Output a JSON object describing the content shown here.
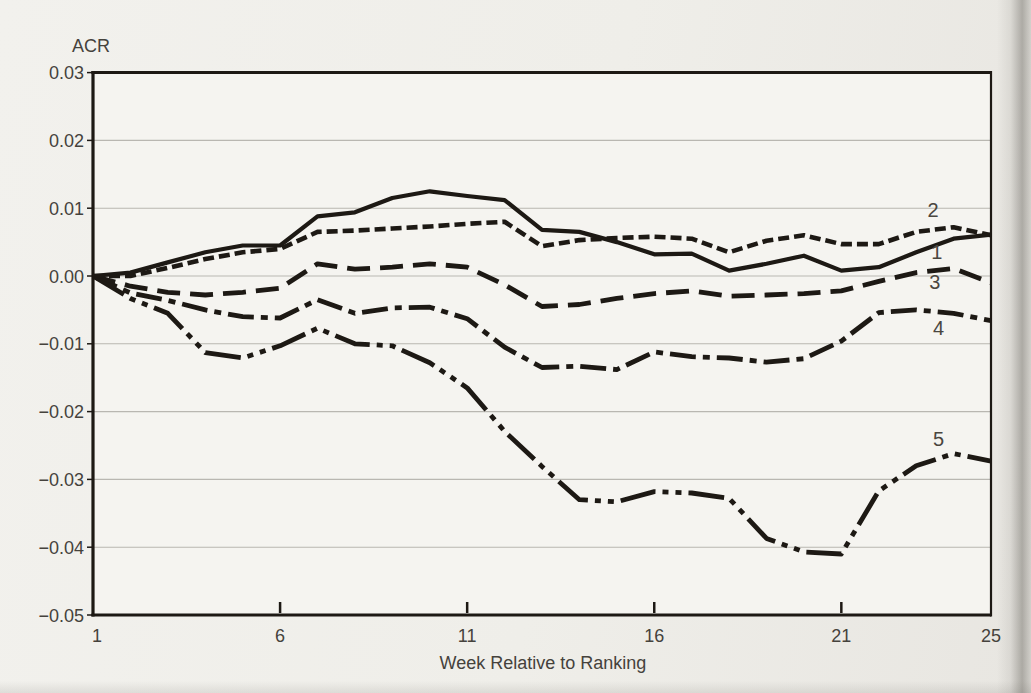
{
  "chart_data": {
    "type": "line",
    "title": "",
    "ylabel": "ACR",
    "xlabel": "Week Relative to Ranking",
    "xlim": [
      1,
      25
    ],
    "ylim": [
      -0.05,
      0.03
    ],
    "grid": "horizontal",
    "legend": "inline-numeric-labels",
    "x": [
      1,
      2,
      3,
      4,
      5,
      6,
      7,
      8,
      9,
      10,
      11,
      12,
      13,
      14,
      15,
      16,
      17,
      18,
      19,
      20,
      21,
      22,
      23,
      24,
      25
    ],
    "x_ticks": [
      1,
      6,
      11,
      16,
      21,
      25
    ],
    "x_tick_labels": [
      "1",
      "6",
      "11",
      "16",
      "21",
      "25"
    ],
    "y_ticks": [
      0.03,
      0.02,
      0.01,
      0.0,
      -0.01,
      -0.02,
      -0.03,
      -0.04,
      -0.05
    ],
    "y_tick_labels": [
      "0.03",
      "0.02",
      "0.01",
      "0.00",
      "−0.01",
      "−0.02",
      "−0.03",
      "−0.04",
      "−0.05"
    ],
    "series": [
      {
        "name": "1",
        "style": "solid",
        "values": [
          0,
          0.0005,
          0.002,
          0.0035,
          0.0045,
          0.0045,
          0.0088,
          0.0094,
          0.0115,
          0.0125,
          0.0118,
          0.0112,
          0.0068,
          0.0065,
          0.005,
          0.0032,
          0.0033,
          0.0008,
          0.0018,
          0.003,
          0.0008,
          0.0013,
          0.0035,
          0.0055,
          0.0061
        ]
      },
      {
        "name": "2",
        "style": "short-dash",
        "values": [
          0,
          0,
          0.0012,
          0.0025,
          0.0035,
          0.004,
          0.0065,
          0.0067,
          0.007,
          0.0073,
          0.0077,
          0.008,
          0.0044,
          0.0053,
          0.0056,
          0.0058,
          0.0055,
          0.0035,
          0.0052,
          0.006,
          0.0047,
          0.0047,
          0.0065,
          0.0072,
          0.006
        ]
      },
      {
        "name": "3",
        "style": "long-dash",
        "values": [
          0,
          -0.0015,
          -0.0024,
          -0.0028,
          -0.0024,
          -0.0018,
          0.0018,
          0.001,
          0.0013,
          0.0018,
          0.0013,
          -0.0013,
          -0.0045,
          -0.0042,
          -0.0033,
          -0.0026,
          -0.0022,
          -0.003,
          -0.0028,
          -0.0026,
          -0.0022,
          -0.0008,
          0.0005,
          0.0011,
          -0.001
        ]
      },
      {
        "name": "4",
        "style": "dash-dot",
        "values": [
          0,
          -0.0025,
          -0.0036,
          -0.005,
          -0.006,
          -0.0062,
          -0.0035,
          -0.0055,
          -0.0047,
          -0.0046,
          -0.0063,
          -0.0105,
          -0.0135,
          -0.0133,
          -0.0138,
          -0.0112,
          -0.0119,
          -0.0121,
          -0.0127,
          -0.0122,
          -0.0096,
          -0.0054,
          -0.005,
          -0.0055,
          -0.0066
        ]
      },
      {
        "name": "5",
        "style": "dash-dot-dot",
        "values": [
          0,
          -0.0033,
          -0.0055,
          -0.0113,
          -0.0121,
          -0.0103,
          -0.0077,
          -0.01,
          -0.0103,
          -0.0128,
          -0.0165,
          -0.0229,
          -0.0281,
          -0.033,
          -0.0333,
          -0.0318,
          -0.032,
          -0.0328,
          -0.0387,
          -0.0407,
          -0.041,
          -0.0317,
          -0.028,
          -0.0262,
          -0.0273
        ]
      }
    ],
    "series_labels": [
      {
        "text": "2",
        "week": 23.45,
        "value": 0.0098
      },
      {
        "text": "1",
        "week": 23.55,
        "value": 0.0036
      },
      {
        "text": "3",
        "week": 23.5,
        "value": -0.0009
      },
      {
        "text": "4",
        "week": 23.6,
        "value": -0.0076
      },
      {
        "text": "5",
        "week": 23.6,
        "value": -0.024
      }
    ],
    "colors": {
      "line": "#1d1914",
      "grid": "#b9b7b1",
      "frame": "#1d1914",
      "text": "#45423c",
      "plot_bg": "#f5f4f0"
    }
  }
}
